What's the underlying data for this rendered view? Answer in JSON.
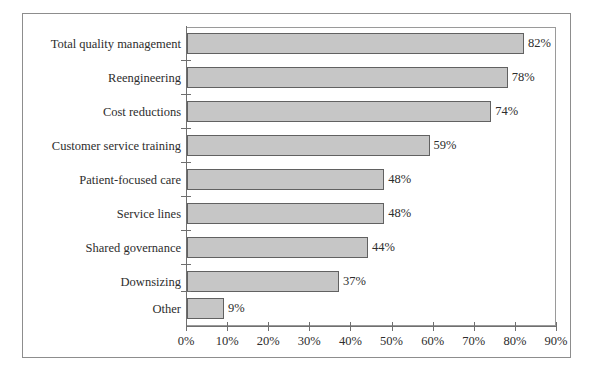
{
  "chart_data": {
    "type": "bar",
    "orientation": "horizontal",
    "title": "",
    "subtitle": "",
    "xlabel": "",
    "ylabel": "",
    "categories": [
      "Total quality management",
      "Reengineering",
      "Cost reductions",
      "Customer service training",
      "Patient-focused care",
      "Service lines",
      "Shared governance",
      "Downsizing",
      "Other"
    ],
    "values": [
      82,
      78,
      74,
      59,
      48,
      48,
      44,
      37,
      9
    ],
    "value_labels": [
      "82%",
      "78%",
      "74%",
      "59%",
      "48%",
      "48%",
      "44%",
      "37%",
      "9%"
    ],
    "xlim": [
      0,
      90
    ],
    "xticks": [
      0,
      10,
      20,
      30,
      40,
      50,
      60,
      70,
      80,
      90
    ],
    "xticklabels": [
      "0%",
      "10%",
      "20%",
      "30%",
      "40%",
      "50%",
      "60%",
      "70%",
      "80%",
      "90%"
    ],
    "grid": false,
    "legend": false,
    "legend_position": "none",
    "bar_fill_color": "#c6c6c6",
    "bar_border_color": "#616161",
    "axis_color": "#6f6f6f",
    "text_color": "#2d2d2d",
    "background_color": "#ffffff",
    "frame_color": "#8d8d8d"
  }
}
